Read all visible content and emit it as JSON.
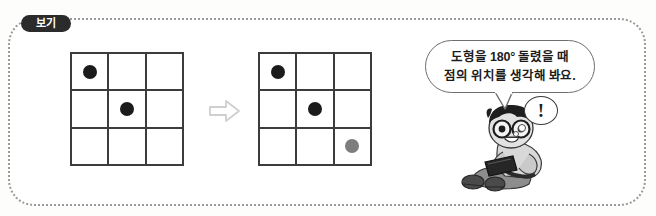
{
  "page": {
    "background_color": "#fdfdfc",
    "width": 656,
    "height": 216
  },
  "example_box": {
    "label": "보기",
    "border_style": "dotted",
    "border_color": "#9a9a9a"
  },
  "transform": {
    "arrow_label": "⇨",
    "arrow_color": "#cfcfcf",
    "description": "도형을 180도 회전"
  },
  "grids": [
    {
      "name": "before",
      "rows": 3,
      "cols": 3,
      "line_color": "#3c3c3c",
      "dots": [
        {
          "row": 0,
          "col": 0,
          "color": "#1b1b1b",
          "shade": "black"
        },
        {
          "row": 1,
          "col": 1,
          "color": "#1b1b1b",
          "shade": "black"
        }
      ]
    },
    {
      "name": "after",
      "rows": 3,
      "cols": 3,
      "line_color": "#3c3c3c",
      "dots": [
        {
          "row": 0,
          "col": 0,
          "color": "#1b1b1b",
          "shade": "black"
        },
        {
          "row": 1,
          "col": 1,
          "color": "#1b1b1b",
          "shade": "black"
        },
        {
          "row": 2,
          "col": 2,
          "color": "#7d7d7d",
          "shade": "gray"
        }
      ]
    }
  ],
  "speech_bubble": {
    "line1": "도형을 180° 돌렸을 때",
    "line2": "점의 위치를 생각해 봐요.",
    "border_color": "#6e6e6e"
  },
  "thought_bubble": {
    "mark": "!",
    "border_color": "#3a3a3a"
  },
  "character": {
    "description": "안경을 쓴 남자아이가 태블릿을 들고 앉아 있는 그림"
  }
}
